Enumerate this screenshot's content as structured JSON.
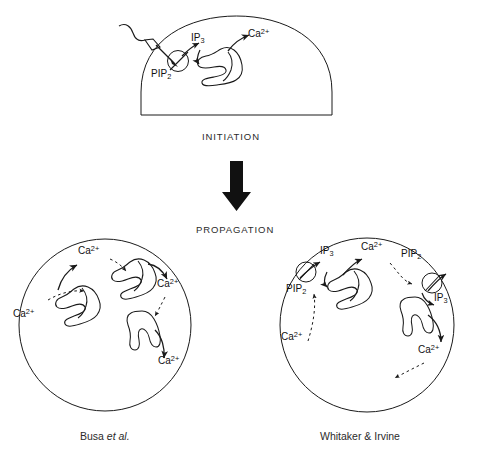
{
  "figure": {
    "title_fragment": "",
    "stages": [
      {
        "id": "initiation",
        "label": "INITIATION"
      },
      {
        "id": "propagation",
        "label": "PROPAGATION"
      }
    ],
    "flow_arrow": {
      "name": "downward-arrow",
      "direction": "down"
    },
    "initiation_cell": {
      "shape": "dome",
      "labels": [
        {
          "id": "pip2",
          "text": "PIP",
          "sub": "2",
          "sup": ""
        },
        {
          "id": "ip3",
          "text": "IP",
          "sub": "3",
          "sup": ""
        },
        {
          "id": "ca",
          "text": "Ca",
          "sub": "",
          "sup": "2+"
        }
      ],
      "sperm_entry": "fertilizing-sperm-squiggle",
      "organelles": 1,
      "receptors": 1
    },
    "models": [
      {
        "id": "busa",
        "caption": "Busa ",
        "caption_italic": "et al.",
        "caption_tail": "",
        "cell_shape": "circle",
        "organelles": 3,
        "receptors": 0,
        "ca_labels": [
          {
            "text": "Ca",
            "sup": "2+"
          },
          {
            "text": "Ca",
            "sup": "2+"
          },
          {
            "text": "Ca",
            "sup": "2+"
          },
          {
            "text": "Ca",
            "sup": "2+"
          }
        ]
      },
      {
        "id": "whitaker-irvine",
        "caption": "Whitaker & Irvine",
        "caption_italic": "",
        "caption_tail": "",
        "cell_shape": "circle",
        "organelles": 2,
        "receptors": 2,
        "pip2_labels": [
          {
            "text": "PIP",
            "sub": "2"
          },
          {
            "text": "PIP",
            "sub": "2"
          }
        ],
        "ip3_labels": [
          {
            "text": "IP",
            "sub": "3"
          },
          {
            "text": "IP",
            "sub": "3"
          }
        ],
        "ca_labels": [
          {
            "text": "Ca",
            "sup": "2+"
          },
          {
            "text": "Ca",
            "sup": "2+"
          },
          {
            "text": "Ca",
            "sup": "2+"
          }
        ]
      }
    ],
    "legend": {
      "solid_arrow_meaning": "release",
      "dashed_arrow_meaning": "diffusion"
    },
    "colors": {
      "ink": "#1a1a1a",
      "background": "#ffffff",
      "text": "#2b2b2b"
    }
  }
}
